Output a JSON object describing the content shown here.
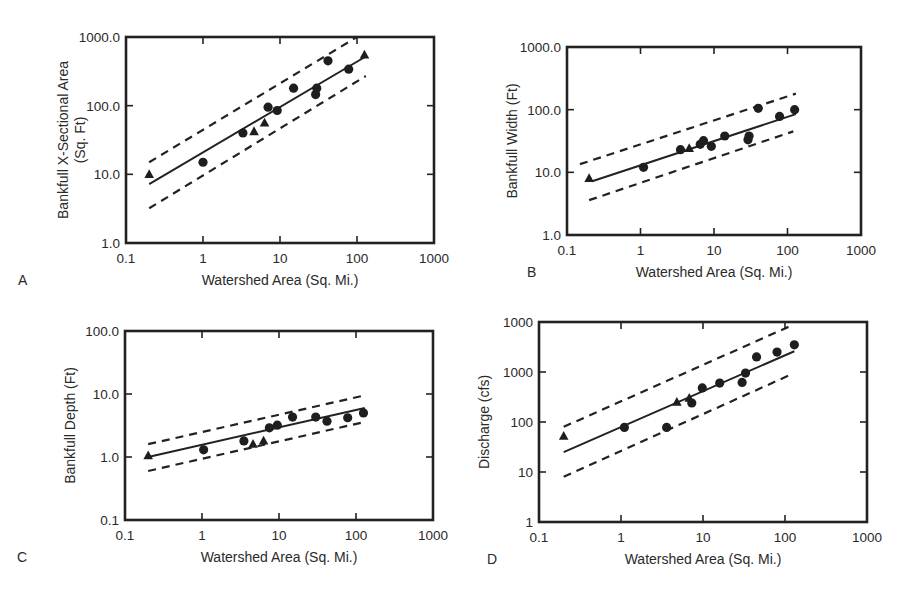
{
  "figure": {
    "panels": [
      "A",
      "B",
      "C",
      "D"
    ]
  },
  "chart_data": [
    {
      "panel": "A",
      "type": "scatter",
      "title": "",
      "xlabel": "Watershed Area (Sq. Mi.)",
      "ylabel": "Bankfull X-Sectional Area (Sq. Ft)",
      "ylabel_lines": [
        "Bankfull X-Sectional Area",
        "(Sq. Ft)"
      ],
      "xscale": "log",
      "yscale": "log",
      "xlim": [
        0.1,
        1000
      ],
      "ylim": [
        1,
        1000
      ],
      "xticks": [
        "0.1",
        "1",
        "10",
        "100",
        "1000"
      ],
      "yticks": [
        "1.0",
        "10.0",
        "100.0",
        "1000.0"
      ],
      "frame": {
        "left": 126,
        "top": 37,
        "right": 434,
        "bottom": 243
      },
      "series": [
        {
          "name": "circles",
          "marker": "circle",
          "points": [
            [
              1.0,
              15
            ],
            [
              3.3,
              40
            ],
            [
              7.0,
              95
            ],
            [
              9.2,
              85
            ],
            [
              15,
              180
            ],
            [
              29,
              145
            ],
            [
              30,
              180
            ],
            [
              42,
              450
            ],
            [
              78,
              340
            ]
          ]
        },
        {
          "name": "triangles",
          "marker": "triangle",
          "points": [
            [
              0.2,
              10
            ],
            [
              4.6,
              42
            ],
            [
              6.3,
              56
            ],
            [
              125,
              550
            ]
          ]
        }
      ],
      "regression": {
        "from": [
          0.2,
          7.2
        ],
        "to": [
          130,
          520
        ]
      },
      "upper_bound": {
        "from": [
          0.2,
          15
        ],
        "to": [
          100,
          1000
        ]
      },
      "lower_bound": {
        "from": [
          0.2,
          3.2
        ],
        "to": [
          130,
          270
        ]
      },
      "grid": false,
      "legend": null
    },
    {
      "panel": "B",
      "type": "scatter",
      "title": "",
      "xlabel": "Watershed Area (Sq. Mi.)",
      "ylabel": "Bankfull Width (Ft)",
      "ylabel_lines": [
        "Bankfull Width (Ft)"
      ],
      "xscale": "log",
      "yscale": "log",
      "xlim": [
        0.1,
        1000
      ],
      "ylim": [
        1,
        1000
      ],
      "xticks": [
        "0.1",
        "1",
        "10",
        "100",
        "1000"
      ],
      "yticks": [
        "1.0",
        "10.0",
        "100.0",
        "1000.0"
      ],
      "frame": {
        "left": 567,
        "top": 47,
        "right": 861,
        "bottom": 235
      },
      "series": [
        {
          "name": "circles",
          "marker": "circle",
          "points": [
            [
              1.1,
              12
            ],
            [
              3.5,
              23
            ],
            [
              6.5,
              28
            ],
            [
              7.2,
              32
            ],
            [
              9.2,
              26
            ],
            [
              14,
              38
            ],
            [
              29,
              33
            ],
            [
              30,
              38
            ],
            [
              40,
              105
            ],
            [
              78,
              78
            ],
            [
              125,
              100
            ]
          ]
        },
        {
          "name": "triangles",
          "marker": "triangle",
          "points": [
            [
              0.2,
              8
            ],
            [
              4.6,
              24
            ]
          ]
        }
      ],
      "regression": {
        "from": [
          0.22,
          7.2
        ],
        "to": [
          130,
          85
        ]
      },
      "upper_bound": {
        "from": [
          0.15,
          13.5
        ],
        "to": [
          130,
          180
        ]
      },
      "lower_bound": {
        "from": [
          0.2,
          3.6
        ],
        "to": [
          120,
          45
        ]
      },
      "grid": false,
      "legend": null
    },
    {
      "panel": "C",
      "type": "scatter",
      "title": "",
      "xlabel": "Watershed Area (Sq. Mi.)",
      "ylabel": "Bankfull Depth (Ft)",
      "ylabel_lines": [
        "Bankfull Depth (Ft)"
      ],
      "xscale": "log",
      "yscale": "log",
      "xlim": [
        0.1,
        1000
      ],
      "ylim": [
        0.1,
        100
      ],
      "xticks": [
        "0.1",
        "1",
        "10",
        "100",
        "1000"
      ],
      "yticks": [
        "0.1",
        "1.0",
        "10.0",
        "100.0"
      ],
      "frame": {
        "left": 125,
        "top": 331,
        "right": 433,
        "bottom": 520
      },
      "series": [
        {
          "name": "circles",
          "marker": "circle",
          "points": [
            [
              1.05,
              1.3
            ],
            [
              3.5,
              1.8
            ],
            [
              7.5,
              2.9
            ],
            [
              9.5,
              3.2
            ],
            [
              15,
              4.3
            ],
            [
              30,
              4.3
            ],
            [
              42,
              3.7
            ],
            [
              78,
              4.2
            ],
            [
              125,
              5.0
            ]
          ]
        },
        {
          "name": "triangles",
          "marker": "triangle",
          "points": [
            [
              0.2,
              1.05
            ],
            [
              4.6,
              1.6
            ],
            [
              6.3,
              1.8
            ]
          ]
        }
      ],
      "regression": {
        "from": [
          0.2,
          1.0
        ],
        "to": [
          130,
          6.0
        ]
      },
      "upper_bound": {
        "from": [
          0.2,
          1.6
        ],
        "to": [
          130,
          9.5
        ]
      },
      "lower_bound": {
        "from": [
          0.2,
          0.6
        ],
        "to": [
          130,
          3.6
        ]
      },
      "grid": false,
      "legend": null
    },
    {
      "panel": "D",
      "type": "scatter",
      "title": "",
      "xlabel": "Watershed Area (Sq. Mi.)",
      "ylabel": "Discharge (cfs)",
      "ylabel_lines": [
        "Discharge (cfs)"
      ],
      "xscale": "log",
      "yscale": "log",
      "xlim": [
        0.1,
        1000
      ],
      "ylim": [
        1,
        10000
      ],
      "xticks": [
        "0.1",
        "1",
        "10",
        "100",
        "1000"
      ],
      "yticks": [
        "1",
        "10",
        "100",
        "1000",
        "1000"
      ],
      "frame": {
        "left": 539,
        "top": 322,
        "right": 867,
        "bottom": 522
      },
      "series": [
        {
          "name": "circles",
          "marker": "circle",
          "points": [
            [
              1.1,
              78
            ],
            [
              3.6,
              78
            ],
            [
              7.3,
              240
            ],
            [
              9.8,
              480
            ],
            [
              16,
              600
            ],
            [
              30,
              620
            ],
            [
              33,
              950
            ],
            [
              45,
              2000
            ],
            [
              80,
              2500
            ],
            [
              130,
              3500
            ]
          ]
        },
        {
          "name": "triangles",
          "marker": "triangle",
          "points": [
            [
              0.2,
              52
            ],
            [
              4.8,
              250
            ],
            [
              6.8,
              300
            ]
          ]
        }
      ],
      "regression": {
        "from": [
          0.2,
          25
        ],
        "to": [
          130,
          2600
        ]
      },
      "upper_bound": {
        "from": [
          0.2,
          80
        ],
        "to": [
          120,
          8500
        ]
      },
      "lower_bound": {
        "from": [
          0.2,
          8
        ],
        "to": [
          120,
          900
        ]
      },
      "grid": false,
      "legend": null
    }
  ]
}
